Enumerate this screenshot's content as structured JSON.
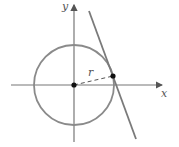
{
  "diagram": {
    "title": "",
    "axes": {
      "x_label": "x",
      "y_label": "y"
    },
    "radius_label": "r",
    "colors": {
      "circle": "#8a8a8a",
      "axes": "#777777",
      "tangent_line": "#7a7a7a",
      "points": "#111111",
      "text": "#555555"
    },
    "geometry": {
      "origin": [
        74,
        85
      ],
      "radius_px": 40,
      "tangent_point": [
        113,
        76
      ],
      "tangent_line": [
        [
          89,
          11
        ],
        [
          136,
          139
        ]
      ]
    }
  }
}
